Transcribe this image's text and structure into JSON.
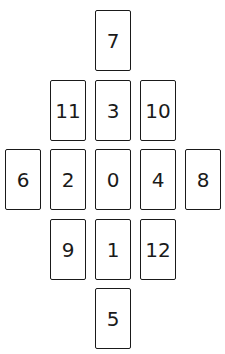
{
  "diagram": {
    "type": "card-spread-layout",
    "cards": [
      {
        "label": "7",
        "x": 95,
        "y": 10
      },
      {
        "label": "11",
        "x": 50,
        "y": 80
      },
      {
        "label": "3",
        "x": 95,
        "y": 80
      },
      {
        "label": "10",
        "x": 140,
        "y": 80
      },
      {
        "label": "6",
        "x": 5,
        "y": 149
      },
      {
        "label": "2",
        "x": 50,
        "y": 149
      },
      {
        "label": "0",
        "x": 95,
        "y": 149
      },
      {
        "label": "4",
        "x": 140,
        "y": 149
      },
      {
        "label": "8",
        "x": 185,
        "y": 149
      },
      {
        "label": "9",
        "x": 50,
        "y": 219
      },
      {
        "label": "1",
        "x": 95,
        "y": 219
      },
      {
        "label": "12",
        "x": 140,
        "y": 219
      },
      {
        "label": "5",
        "x": 95,
        "y": 288
      }
    ]
  }
}
